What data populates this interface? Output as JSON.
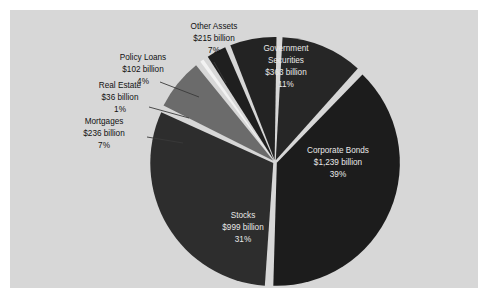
{
  "figure": {
    "background_color": "#ffffff",
    "panel_color": "#d7d7d7",
    "panel_rect": [
      10,
      10,
      468,
      278
    ]
  },
  "chart_data": {
    "type": "pie",
    "title": "",
    "subtitle": "",
    "xlabel": "",
    "ylabel": "",
    "grid": false,
    "legend_position": "none",
    "units": "billion US dollars",
    "total_label": "",
    "center": [
      275,
      162
    ],
    "radius": 123,
    "start_angle_deg": -88,
    "direction": "clockwise",
    "categories": [
      "Government Securities",
      "Corporate Bonds",
      "Stocks",
      "Mortgages",
      "Real Estate",
      "Policy Loans",
      "Other Assets"
    ],
    "values": [
      363,
      1239,
      999,
      236,
      36,
      102,
      215
    ],
    "percents": [
      11,
      39,
      31,
      7,
      1,
      4,
      7
    ],
    "value_labels": [
      "$363 billion",
      "$1,239 billion",
      "$999 billion",
      "$236 billion",
      "$36 billion",
      "$102 billion",
      "$215 billion"
    ],
    "percent_labels": [
      "11%",
      "39%",
      "31%",
      "7%",
      "1%",
      "4%",
      "7%"
    ],
    "colors": [
      "#262626",
      "#1c1c1c",
      "#2d2d2d",
      "#6b6b6b",
      "#f2f2f2",
      "#1f1f1f",
      "#232323"
    ],
    "slices": [
      {
        "name": "Government Securities",
        "value": 363,
        "value_label": "$363 billion",
        "percent": 11,
        "percent_label": "11%",
        "color": "#262626",
        "label_placement": "inside",
        "label_lines": [
          "Government",
          "Securities",
          "$363 billion",
          "11%"
        ]
      },
      {
        "name": "Corporate Bonds",
        "value": 1239,
        "value_label": "$1,239 billion",
        "percent": 39,
        "percent_label": "39%",
        "color": "#1c1c1c",
        "label_placement": "inside",
        "label_lines": [
          "Corporate Bonds",
          "$1,239 billion",
          "39%"
        ]
      },
      {
        "name": "Stocks",
        "value": 999,
        "value_label": "$999 billion",
        "percent": 31,
        "percent_label": "31%",
        "color": "#2d2d2d",
        "label_placement": "inside",
        "label_lines": [
          "Stocks",
          "$999 billion",
          "31%"
        ]
      },
      {
        "name": "Mortgages",
        "value": 236,
        "value_label": "$236 billion",
        "percent": 7,
        "percent_label": "7%",
        "color": "#6b6b6b",
        "label_placement": "outside",
        "label_lines": [
          "Mortgages",
          "$236 billion",
          "7%"
        ]
      },
      {
        "name": "Real Estate",
        "value": 36,
        "value_label": "$36 billion",
        "percent": 1,
        "percent_label": "1%",
        "color": "#f2f2f2",
        "label_placement": "outside",
        "label_lines": [
          "Real Estate",
          "$36 billion",
          "1%"
        ]
      },
      {
        "name": "Policy Loans",
        "value": 102,
        "value_label": "$102 billion",
        "percent": 4,
        "percent_label": "4%",
        "color": "#1f1f1f",
        "label_placement": "outside",
        "label_lines": [
          "Policy Loans",
          "$102 billion",
          "4%"
        ]
      },
      {
        "name": "Other Assets",
        "value": 215,
        "value_label": "$215 billion",
        "percent": 7,
        "percent_label": "7%",
        "color": "#232323",
        "label_placement": "outside",
        "label_lines": [
          "Other Assets",
          "$215 billion",
          "7%"
        ]
      }
    ]
  },
  "labels": {
    "government_securities": {
      "l1": "Government",
      "l2": "Securities",
      "l3": "$363 billion",
      "l4": "11%"
    },
    "corporate_bonds": {
      "l1": "Corporate Bonds",
      "l2": "$1,239 billion",
      "l3": "39%"
    },
    "stocks": {
      "l1": "Stocks",
      "l2": "$999 billion",
      "l3": "31%"
    },
    "mortgages": {
      "l1": "Mortgages",
      "l2": "$236 billion",
      "l3": "7%"
    },
    "real_estate": {
      "l1": "Real Estate",
      "l2": "$36 billion",
      "l3": "1%"
    },
    "policy_loans": {
      "l1": "Policy Loans",
      "l2": "$102 billion",
      "l3": "4%"
    },
    "other_assets": {
      "l1": "Other Assets",
      "l2": "$215 billion",
      "l3": "7%"
    }
  }
}
